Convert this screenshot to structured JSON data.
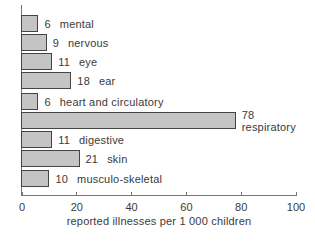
{
  "chart_data": {
    "type": "bar",
    "orientation": "horizontal",
    "title": "",
    "xlabel": "reported illnesses per 1 000 children",
    "ylabel": "",
    "xlim": [
      0,
      100
    ],
    "xticks": [
      "0",
      "20",
      "40",
      "60",
      "80",
      "100"
    ],
    "grid": false,
    "legend": null,
    "categories": [
      "mental",
      "nervous",
      "eye",
      "ear",
      "heart and circulatory",
      "respiratory",
      "digestive",
      "skin",
      "musculo-skeletal"
    ],
    "values": [
      6,
      9,
      11,
      18,
      6,
      78,
      11,
      21,
      10
    ],
    "value_labels": [
      "6",
      "9",
      "11",
      "18",
      "6",
      "78",
      "11",
      "21",
      "10"
    ],
    "bar_color": "#c4c4c4",
    "bar_edge_color": "#444444"
  }
}
